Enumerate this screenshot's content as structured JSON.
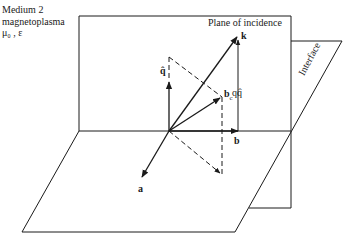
{
  "figure": {
    "type": "3D vector geometry diagram",
    "medium_label": {
      "line1": "Medium 2",
      "line2": "magnetoplasma",
      "line3": "μ₀ , ε"
    },
    "plane_of_incidence_label": "Plane of incidence",
    "interface_label": "Interface",
    "vectors": {
      "k": "k",
      "q_hat": "q̂",
      "b_c": "b",
      "b_c_sub": "c",
      "q_q_hat": "qq̂",
      "b": "b",
      "a": "a"
    },
    "colors": {
      "line": "#1a1a1a",
      "background": "#ffffff"
    }
  }
}
